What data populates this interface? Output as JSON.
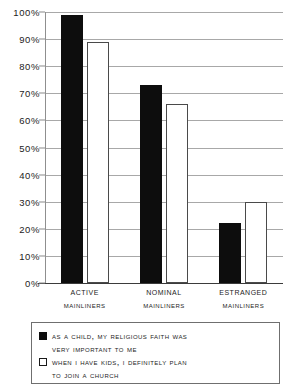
{
  "chart_data": {
    "type": "bar",
    "title": "",
    "xlabel": "",
    "ylabel": "",
    "ylim": [
      0,
      100
    ],
    "grid": true,
    "legend_position": "bottom",
    "categories": [
      "Active Mainliners",
      "Nominal Mainliners",
      "Estranged Mainliners"
    ],
    "category_lines": [
      {
        "line1": "Active",
        "line2": "Mainliners"
      },
      {
        "line1": "Nominal",
        "line2": "Mainliners"
      },
      {
        "line1": "Estranged",
        "line2": "Mainliners"
      }
    ],
    "series": [
      {
        "name": "As a child, my religious faith was very important to me",
        "name_line1": "As a child, my religious faith was",
        "name_line2": "very important to me",
        "color": "#0d0d0d",
        "style": "filled",
        "values": [
          99,
          73,
          22
        ]
      },
      {
        "name": "When I have kids, I definitely plan to join a church",
        "name_line1": "When I have kids, I definitely plan",
        "name_line2": "to join a church",
        "color": "#ffffff",
        "style": "hollow",
        "values": [
          89,
          66,
          30
        ]
      }
    ],
    "y_ticks": [
      {
        "value": 100,
        "label": "100%"
      },
      {
        "value": 90,
        "label": "90%"
      },
      {
        "value": 80,
        "label": "80%"
      },
      {
        "value": 70,
        "label": "70%"
      },
      {
        "value": 60,
        "label": "60%"
      },
      {
        "value": 50,
        "label": "50%"
      },
      {
        "value": 40,
        "label": "40%"
      },
      {
        "value": 30,
        "label": "30%"
      },
      {
        "value": 20,
        "label": "20%"
      },
      {
        "value": 10,
        "label": "10%"
      },
      {
        "value": 0,
        "label": "0%"
      }
    ]
  }
}
